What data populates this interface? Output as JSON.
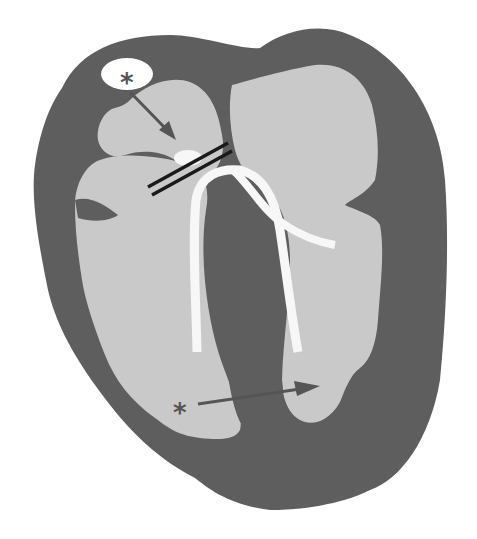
{
  "diagram": {
    "type": "schematic heart cross-section (four-chamber view)",
    "colors": {
      "background": "#ffffff",
      "myocardium": "#5e5e5e",
      "chamber": "#c9c9c9",
      "catheter": "#f7f7f7",
      "clip_lines": "#1a1a1a",
      "arrow": "#555555",
      "marker": "#555555"
    },
    "markers": [
      {
        "id": "top",
        "symbol": "*",
        "x": 128,
        "y": 72
      },
      {
        "id": "bottom",
        "symbol": "*",
        "x": 181,
        "y": 410
      }
    ],
    "arrows": [
      {
        "id": "upper-arrow",
        "from": [
          130,
          92
        ],
        "to": [
          174,
          138
        ]
      },
      {
        "id": "lower-arrow",
        "from": [
          198,
          404
        ],
        "to": [
          318,
          386
        ]
      }
    ],
    "labels": {
      "marker_top": "*",
      "marker_bottom": "*"
    }
  }
}
